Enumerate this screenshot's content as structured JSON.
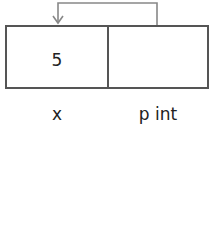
{
  "diagram": {
    "cells": [
      {
        "name": "x",
        "value": "5"
      },
      {
        "name": "p int",
        "value": ""
      }
    ],
    "arrow": {
      "from": "p int",
      "to": "x",
      "color": "#888888"
    },
    "colors": {
      "box_border": "#555555",
      "arrow": "#888888",
      "text": "#222222"
    }
  }
}
